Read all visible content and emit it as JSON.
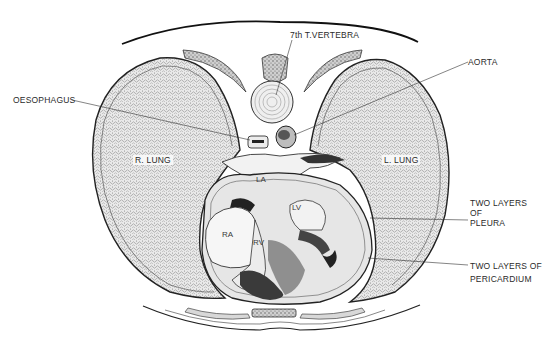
{
  "figure": {
    "background": "#ffffff",
    "ink_color": "#1a1a1a",
    "lung_fill": "#d9d9d9",
    "pericardium_fill": "#e4e4e4"
  },
  "labels": {
    "vertebra": "7th T.VERTEBRA",
    "oesophagus": "OESOPHAGUS",
    "aorta": "AORTA",
    "right_lung": "R. LUNG",
    "left_lung": "L. LUNG",
    "pleura_line1": "TWO LAYERS",
    "pleura_line2": "OF",
    "pleura_line3": "PLEURA",
    "pericardium_line1": "TWO LAYERS OF",
    "pericardium_line2": "PERICARDIUM"
  },
  "chambers": {
    "left_atrium": "LA",
    "left_ventricle": "LV",
    "right_atrium": "RA",
    "right_ventricle": "RV"
  }
}
